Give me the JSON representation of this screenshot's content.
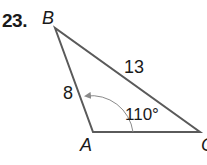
{
  "problem": {
    "number": "23."
  },
  "triangle": {
    "vertices": {
      "A": {
        "label": "A",
        "x": 93,
        "y": 132
      },
      "B": {
        "label": "B",
        "x": 55,
        "y": 28
      },
      "C": {
        "label": "C",
        "x": 200,
        "y": 132
      }
    },
    "sides": {
      "AB": "8",
      "BC": "13"
    },
    "angle": {
      "vertex": "A",
      "label": "110°"
    },
    "colors": {
      "stroke": "#5a5a5a",
      "arc": "#8a8a8a",
      "text": "#1a1a1a"
    }
  }
}
